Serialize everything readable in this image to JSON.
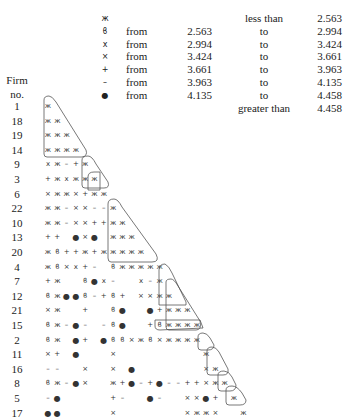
{
  "legend": {
    "rows": [
      {
        "symbol": "ж",
        "from": "",
        "low": "",
        "to": "less than",
        "high": "2.563"
      },
      {
        "symbol": "ϐ",
        "from": "from",
        "low": "2.563",
        "to": "to",
        "high": "2.994"
      },
      {
        "symbol": "ⅹ",
        "from": "from",
        "low": "2.994",
        "to": "to",
        "high": "3.424"
      },
      {
        "symbol": "×",
        "from": "from",
        "low": "3.424",
        "to": "to",
        "high": "3.661"
      },
      {
        "symbol": "+",
        "from": "from",
        "low": "3.661",
        "to": "to",
        "high": "3.963"
      },
      {
        "symbol": "–",
        "from": "from",
        "low": "3.963",
        "to": "to",
        "high": "4.135"
      },
      {
        "symbol": "●",
        "from": "from",
        "low": "4.135",
        "to": "to",
        "high": "4.458"
      },
      {
        "symbol": "",
        "from": "",
        "low": "",
        "to": "greater than",
        "high": "4.458"
      }
    ]
  },
  "axis": {
    "header_line1": "Firm",
    "header_line2": "no."
  },
  "firms": [
    "1",
    "18",
    "19",
    "14",
    "9",
    "3",
    "6",
    "22",
    "10",
    "13",
    "20",
    "4",
    "7",
    "12",
    "21",
    "15",
    "2",
    "11",
    "16",
    "8",
    "5",
    "17"
  ],
  "matrix": [
    "H",
    "HH",
    "HHH",
    "HHHH",
    "XH-+H",
    "+HXHHH",
    "xHHx+HH",
    "HH-xx--H",
    "HH-xx++HH",
    "++ ox* HHH",
    "HB++H+HHHHH",
    "HBxX+- BHHHHH",
    "+H  BoX-  X-H",
    "BHooB-+B+ xxHH",
    "xH  +  Bo  o+HHH",
    "BH-o- -Bo  +BHHHH",
    "BH o+ oBBxHBxHHHH",
    "x+ o   x         H",
    "--  x  x o       xH",
    "BH-ox  H+o-+o--++xHH",
    "-o     +-  o-  xxo+ H",
    "oo     x       xHHx  H"
  ],
  "symbol_map": {
    "H": "ж",
    "B": "ϐ",
    "X": "ⅹ",
    "x": "×",
    "+": "+",
    "-": "–",
    "o": "●",
    "*": "●",
    " ": ""
  }
}
